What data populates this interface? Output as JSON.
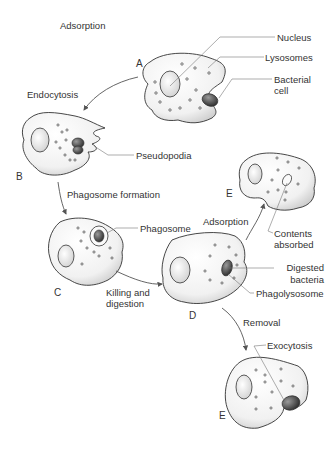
{
  "diagram": {
    "title": "Adsorption",
    "stages": [
      {
        "letter": "A"
      },
      {
        "letter": "B"
      },
      {
        "letter": "C"
      },
      {
        "letter": "D"
      },
      {
        "letter": "E"
      },
      {
        "letter": "E"
      }
    ],
    "steps": {
      "endocytosis": "Endocytosis",
      "phagosome_formation": "Phagosome formation",
      "killing_1": "Killing and",
      "killing_2": "digestion",
      "adsorption": "Adsorption",
      "removal": "Removal"
    },
    "labels": {
      "nucleus": "Nucleus",
      "lysosomes": "Lysosomes",
      "bacterial_1": "Bacterial",
      "bacterial_2": "cell",
      "pseudopodia": "Pseudopodia",
      "phagosome": "Phagosome",
      "contents_1": "Contents",
      "contents_2": "absorbed",
      "digested_1": "Digested",
      "digested_2": "bacteria",
      "phagolysosome": "Phagolysosome",
      "exocytosis": "Exocytosis"
    }
  }
}
